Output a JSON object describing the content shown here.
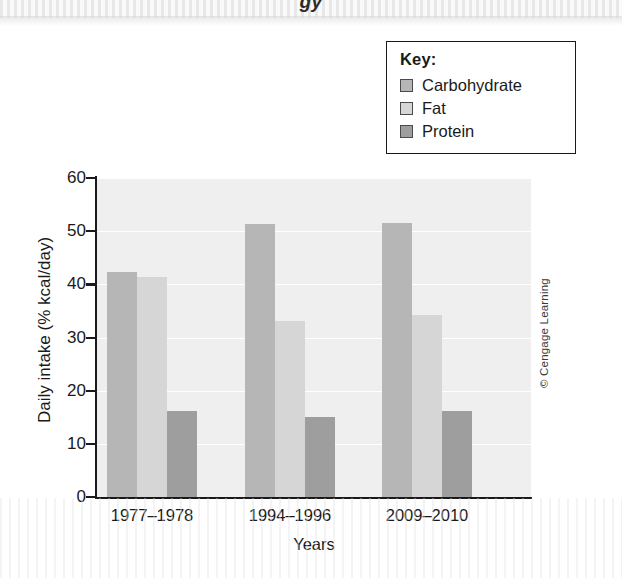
{
  "page": {
    "top_band_text": "gy",
    "credit": "© Cengage Learning"
  },
  "legend": {
    "title": "Key:",
    "items": [
      {
        "label": "Carbohydrate",
        "color": "#b6b6b6"
      },
      {
        "label": "Fat",
        "color": "#d6d6d6"
      },
      {
        "label": "Protein",
        "color": "#9e9e9e"
      }
    ]
  },
  "axes": {
    "ylabel": "Daily intake (% kcal/day)",
    "xlabel": "Years",
    "yticks": [
      "60",
      "50",
      "40",
      "30",
      "20",
      "10",
      "0"
    ]
  },
  "chart_data": {
    "type": "bar",
    "title": "",
    "xlabel": "Years",
    "ylabel": "Daily intake (% kcal/day)",
    "categories": [
      "1977–1978",
      "1994–1996",
      "2009–2010"
    ],
    "series": [
      {
        "name": "Carbohydrate",
        "color": "#b6b6b6",
        "values": [
          42.3,
          51.3,
          51.5
        ]
      },
      {
        "name": "Fat",
        "color": "#d6d6d6",
        "values": [
          41.4,
          33.1,
          34.2
        ]
      },
      {
        "name": "Protein",
        "color": "#9e9e9e",
        "values": [
          16.2,
          15.1,
          16.1
        ]
      }
    ],
    "ylim": [
      0,
      60
    ],
    "ytick_step": 10,
    "grid": true,
    "legend_position": "top-right",
    "plot_background": "#efefef"
  }
}
